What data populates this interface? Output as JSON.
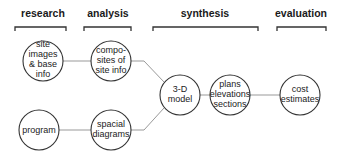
{
  "phases": [
    {
      "id": "research",
      "label": "research"
    },
    {
      "id": "analysis",
      "label": "analysis"
    },
    {
      "id": "synthesis",
      "label": "synthesis"
    },
    {
      "id": "evaluation",
      "label": "evaluation"
    }
  ],
  "nodes": {
    "site_images": {
      "lines": [
        "site",
        "images",
        "& base",
        "info"
      ]
    },
    "composites": {
      "lines": [
        "compo-",
        "sites of",
        "site info"
      ]
    },
    "program": {
      "lines": [
        "program"
      ]
    },
    "spacial_diagrams": {
      "lines": [
        "spacial",
        "diagrams"
      ]
    },
    "model_3d": {
      "lines": [
        "3-D",
        "model"
      ]
    },
    "plans": {
      "lines": [
        "plans",
        "elevations",
        "sections"
      ]
    },
    "cost_estimates": {
      "lines": [
        "cost",
        "estimates"
      ]
    }
  },
  "edges": [
    [
      "site_images",
      "composites"
    ],
    [
      "program",
      "spacial_diagrams"
    ],
    [
      "composites",
      "model_3d"
    ],
    [
      "spacial_diagrams",
      "model_3d"
    ],
    [
      "model_3d",
      "plans"
    ],
    [
      "plans",
      "cost_estimates"
    ]
  ],
  "colors": {
    "stroke": "#333333",
    "edge": "#999999",
    "background": "#ffffff"
  }
}
